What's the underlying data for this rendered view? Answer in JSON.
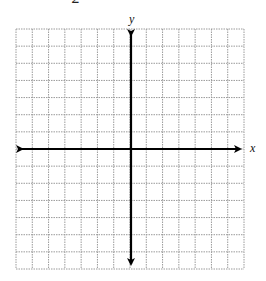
{
  "header": {
    "clipped_label": "2"
  },
  "graph": {
    "type": "coordinate-plane",
    "x_axis_label": "x",
    "y_axis_label": "y",
    "grid": {
      "columns": 14,
      "rows": 14,
      "line_style": "dotted",
      "line_color": "#9a9a9a"
    },
    "axes": {
      "color": "#000000",
      "arrows": "both-ends"
    }
  }
}
